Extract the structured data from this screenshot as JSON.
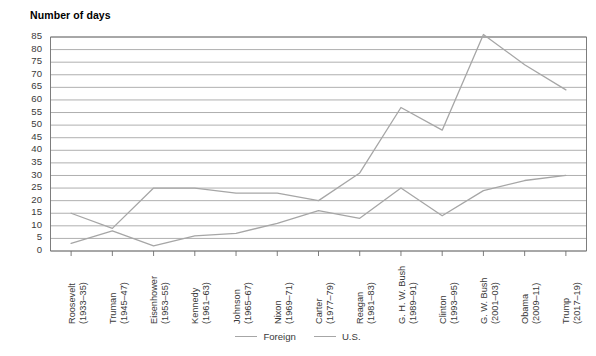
{
  "chart_data": {
    "type": "line",
    "title": "Number of days",
    "xlabel": "",
    "ylabel": "Number of days",
    "ylim": [
      0,
      85
    ],
    "ytick_step": 5,
    "yticks": [
      85,
      80,
      75,
      70,
      65,
      60,
      55,
      50,
      45,
      40,
      35,
      30,
      25,
      20,
      15,
      10,
      5,
      0
    ],
    "grid": true,
    "legend_position": "bottom",
    "categories": [
      "Roosevelt\n(1933–35)",
      "Truman\n(1945–47)",
      "Eisenhower\n(1953–55)",
      "Kennedy\n(1961–63)",
      "Johnson\n(1965–67)",
      "Nixon\n(1969–71)",
      "Carter\n(1977–79)",
      "Reagan\n(1981–83)",
      "G. H. W. Bush\n(1989–91)",
      "Clinton\n(1993–95)",
      "G. W. Bush\n(2001–03)",
      "Obama\n(2009–11)",
      "Trump\n(2017–19)"
    ],
    "category_lines": [
      [
        "Roosevelt",
        "(1933–35)"
      ],
      [
        "Truman",
        "(1945–47)"
      ],
      [
        "Eisenhower",
        "(1953–55)"
      ],
      [
        "Kennedy",
        "(1961–63)"
      ],
      [
        "Johnson",
        "(1965–67)"
      ],
      [
        "Nixon",
        "(1969–71)"
      ],
      [
        "Carter",
        "(1977–79)"
      ],
      [
        "Reagan",
        "(1981–83)"
      ],
      [
        "G. H. W. Bush",
        "(1989–91)"
      ],
      [
        "Clinton",
        "(1993–95)"
      ],
      [
        "G. W. Bush",
        "(2001–03)"
      ],
      [
        "Obama",
        "(2009–11)"
      ],
      [
        "Trump",
        "(2017–19)"
      ]
    ],
    "series": [
      {
        "name": "Foreign",
        "color": "#a6a6a6",
        "values": [
          15,
          9,
          25,
          25,
          23,
          23,
          20,
          31,
          57,
          48,
          86,
          74,
          64
        ]
      },
      {
        "name": "U.S.",
        "color": "#a6a6a6",
        "values": [
          3,
          8,
          2,
          6,
          7,
          11,
          16,
          13,
          25,
          14,
          24,
          28,
          30
        ]
      }
    ]
  },
  "legend": {
    "entries": [
      {
        "label": "Foreign"
      },
      {
        "label": "U.S."
      }
    ]
  },
  "colors": {
    "axis": "#6e6e6e",
    "grid": "#8c8c8c",
    "line": "#9e9e9e",
    "text": "#3a3a3a",
    "title": "#000000",
    "background": "#ffffff"
  }
}
